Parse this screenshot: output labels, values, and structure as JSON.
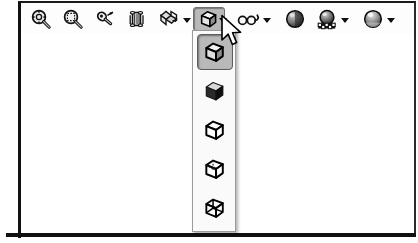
{
  "window": {
    "app_kind": "cad-view-toolbar",
    "background_color": "#ffffff",
    "frame_color": "#111111"
  },
  "toolbar": {
    "name": "View toolbar",
    "highlight_color": "#b9b9b9",
    "border_color": "#6e6e6e",
    "buttons": [
      {
        "id": "zoom-to-fit",
        "label": "Zoom to Fit",
        "icon": "magnifier-fit-icon",
        "x": 8,
        "has_dropdown": false,
        "pressed": false
      },
      {
        "id": "zoom-to-area",
        "label": "Zoom to Area",
        "icon": "magnifier-area-icon",
        "x": 40,
        "has_dropdown": false,
        "pressed": false
      },
      {
        "id": "zoom-in-out",
        "label": "Zoom In/Out",
        "icon": "magnifier-pan-icon",
        "x": 72,
        "has_dropdown": false,
        "pressed": false
      },
      {
        "id": "rotate-view",
        "label": "Rotate View",
        "icon": "rotate-cylinder-icon",
        "x": 104,
        "has_dropdown": false,
        "pressed": false
      },
      {
        "id": "view-orientation",
        "label": "View Orientation",
        "icon": "unfolded-box-icon",
        "x": 136,
        "has_dropdown": true,
        "pressed": false
      },
      {
        "id": "display-style",
        "label": "Display Style",
        "icon": "shaded-cube-edges-icon",
        "x": 172,
        "has_dropdown": true,
        "pressed": true
      },
      {
        "id": "hide-show-items",
        "label": "Hide/Show Items",
        "icon": "spectacles-icon",
        "x": 216,
        "has_dropdown": true,
        "pressed": false
      },
      {
        "id": "edit-appearance",
        "label": "Edit Appearance",
        "icon": "sphere-shaded-icon",
        "x": 262,
        "has_dropdown": false,
        "pressed": false
      },
      {
        "id": "apply-scene",
        "label": "Apply Scene",
        "icon": "sphere-checker-icon",
        "x": 294,
        "has_dropdown": true,
        "pressed": false
      },
      {
        "id": "view-settings",
        "label": "View Settings",
        "icon": "sphere-gloss-icon",
        "x": 340,
        "has_dropdown": true,
        "pressed": false
      }
    ]
  },
  "flyout": {
    "owner_button": "display-style",
    "name": "Display Style flyout",
    "selected_index": 0,
    "items": [
      {
        "id": "shaded-with-edges",
        "label": "Shaded With Edges",
        "icon": "cube-shaded-edges-icon",
        "selected": true
      },
      {
        "id": "shaded",
        "label": "Shaded",
        "icon": "cube-shaded-icon",
        "selected": false
      },
      {
        "id": "hidden-lines-removed",
        "label": "Hidden Lines Removed",
        "icon": "cube-outline-icon",
        "selected": false
      },
      {
        "id": "hidden-lines-visible",
        "label": "Hidden Lines Visible",
        "icon": "cube-dashed-icon",
        "selected": false
      },
      {
        "id": "wireframe",
        "label": "Wireframe",
        "icon": "cube-wireframe-icon",
        "selected": false
      }
    ]
  },
  "cursor": {
    "name": "mouse-pointer",
    "x": 222,
    "y": 18
  }
}
